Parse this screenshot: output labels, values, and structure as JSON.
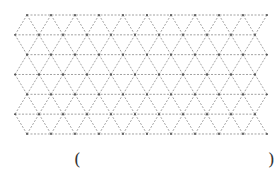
{
  "diagram": {
    "type": "triangular-dot-grid",
    "rows": 6,
    "row_height": 19.83,
    "side": 24,
    "segments_per_line": 10,
    "top_y": 15,
    "offsets_x": [
      27,
      15
    ],
    "line_color": "#8a8a8a",
    "vertex_color": "#444444",
    "dash": "2,1.5"
  },
  "answer_area": {
    "left_bracket": "(",
    "right_bracket": ")"
  }
}
